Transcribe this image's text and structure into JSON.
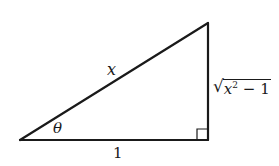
{
  "figure": {
    "type": "right-triangle",
    "stroke_color": "#1a1a1a",
    "vertices": {
      "bottom_left": [
        20,
        140
      ],
      "bottom_right": [
        208,
        140
      ],
      "top_right": [
        208,
        23
      ]
    },
    "right_angle_marker": {
      "corner": "bottom_right",
      "size": 11
    },
    "labels": {
      "hypotenuse": "x",
      "angle": "θ",
      "adjacent": "1",
      "opposite": {
        "radical": "√",
        "base": "x",
        "exponent": "2",
        "rest": " − 1",
        "full_text": "√(x² − 1)"
      }
    }
  }
}
